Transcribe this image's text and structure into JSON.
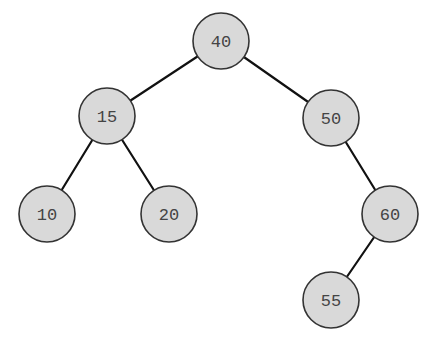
{
  "diagram": {
    "type": "binary-search-tree",
    "colors": {
      "background": "#ffffff",
      "node_fill": "#d9d9d9",
      "node_stroke": "#333333",
      "edge": "#111111",
      "label": "#444444"
    },
    "node_radius": 28,
    "nodes": [
      {
        "id": "n40",
        "label": "40",
        "x": 221,
        "y": 41
      },
      {
        "id": "n15",
        "label": "15",
        "x": 107,
        "y": 116
      },
      {
        "id": "n50",
        "label": "50",
        "x": 331,
        "y": 118
      },
      {
        "id": "n10",
        "label": "10",
        "x": 47,
        "y": 214
      },
      {
        "id": "n20",
        "label": "20",
        "x": 169,
        "y": 214
      },
      {
        "id": "n60",
        "label": "60",
        "x": 390,
        "y": 214
      },
      {
        "id": "n55",
        "label": "55",
        "x": 331,
        "y": 300
      }
    ],
    "edges": [
      {
        "from": "n40",
        "to": "n15"
      },
      {
        "from": "n40",
        "to": "n50"
      },
      {
        "from": "n15",
        "to": "n10"
      },
      {
        "from": "n15",
        "to": "n20"
      },
      {
        "from": "n50",
        "to": "n60"
      },
      {
        "from": "n60",
        "to": "n55"
      }
    ]
  }
}
